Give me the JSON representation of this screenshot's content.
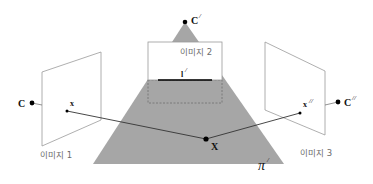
{
  "diagram": {
    "colors": {
      "plane_fill": "#a6a6a6",
      "image_border": "#9a9a9a",
      "ray_line": "#444444",
      "point": "#000000",
      "image2_fill": "#ffffff",
      "line_l": "#000000",
      "dashed": "#6e6e6e"
    },
    "labels": {
      "camera1": "C",
      "camera2": "C",
      "camera2_prime": "/",
      "camera3": "C",
      "camera3_prime": "//",
      "point1": "x",
      "point3": "x",
      "point3_prime": "//",
      "world_point": "X",
      "line": "l",
      "line_prime": "/",
      "plane": "π",
      "plane_prime": "/",
      "image1": "이미지 1",
      "image2": "이미지 2",
      "image3": "이미지 3"
    }
  }
}
